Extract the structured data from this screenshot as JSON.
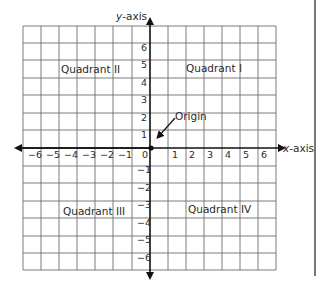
{
  "diagram": {
    "type": "coordinate-plane",
    "axes": {
      "x_label": "x-axis",
      "y_label": "y-axis",
      "x_ticks": [
        "−6",
        "−5",
        "−4",
        "−3",
        "−2",
        "−1",
        "0",
        "1",
        "2",
        "3",
        "4",
        "5",
        "6"
      ],
      "y_ticks_positive": [
        "6",
        "5",
        "4",
        "3",
        "2",
        "1"
      ],
      "y_ticks_negative": [
        "−1",
        "−2",
        "−3",
        "−4",
        "−5",
        "−6"
      ]
    },
    "quadrants": {
      "q1": "Quadrant I",
      "q2": "Quadrant II",
      "q3": "Quadrant III",
      "q4": "Quadrant IV"
    },
    "origin_label": "Origin",
    "colors": {
      "grid": "#6e6e6e",
      "axis": "#111111",
      "text": "#2a2a2a",
      "background": "#ffffff"
    }
  }
}
